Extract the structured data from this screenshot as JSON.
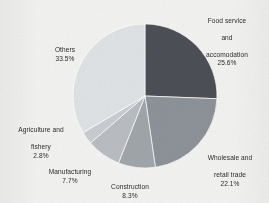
{
  "chart_data": {
    "type": "pie",
    "title": "",
    "subtitle": "",
    "xlabel": "",
    "ylabel": "",
    "legend_position": "none",
    "labels_position": "outside",
    "start_angle_deg": 0,
    "direction": "clockwise",
    "categories": [
      "Food service and accomodation",
      "Wholesale and retail trade",
      "Construction",
      "Manufacturing",
      "Agriculture and fishery",
      "Others"
    ],
    "values": [
      25.6,
      22.1,
      8.3,
      7.7,
      2.8,
      33.5
    ],
    "value_unit": "%",
    "slices": [
      {
        "name": "Food service and accomodation",
        "label_line1": "Food service",
        "label_line2": "and",
        "label_line3": "accomodation",
        "value": 25.6,
        "value_text": "25.6%",
        "color": "#4d5057"
      },
      {
        "name": "Wholesale and retail trade",
        "label_line1": "Wholesale and",
        "label_line2": "retail trade",
        "label_line3": "",
        "value": 22.1,
        "value_text": "22.1%",
        "color": "#8d9298"
      },
      {
        "name": "Construction",
        "label_line1": "Construction",
        "label_line2": "",
        "label_line3": "",
        "value": 8.3,
        "value_text": "8.3%",
        "color": "#a0a5aa"
      },
      {
        "name": "Manufacturing",
        "label_line1": "Manufacturing",
        "label_line2": "",
        "label_line3": "",
        "value": 7.7,
        "value_text": "7.7%",
        "color": "#b9bdc1"
      },
      {
        "name": "Agriculture and fishery",
        "label_line1": "Agriculture and",
        "label_line2": "fishery",
        "label_line3": "",
        "value": 2.8,
        "value_text": "2.8%",
        "color": "#c9ccd0"
      },
      {
        "name": "Others",
        "label_line1": "Others",
        "label_line2": "",
        "label_line3": "",
        "value": 33.5,
        "value_text": "33.5%",
        "color": "#dfe2e4"
      }
    ],
    "geometry": {
      "center_x": 145,
      "center_y": 96,
      "radius": 72
    },
    "background_color": "#f2f2f0",
    "text_color": "#2b2b2b"
  }
}
